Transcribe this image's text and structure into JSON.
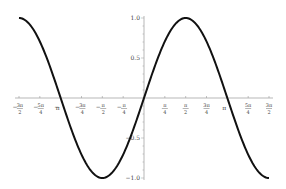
{
  "chart_data": {
    "type": "line",
    "title": "",
    "xlabel": "",
    "ylabel": "",
    "function": "sin(x)",
    "xlim": [
      -4.712,
      4.712
    ],
    "ylim": [
      -1.0,
      1.0
    ],
    "grid": false,
    "legend": null,
    "x_ticks": [
      {
        "value": -4.712,
        "label_num": "3π",
        "label_den": "2",
        "sign": "-"
      },
      {
        "value": -3.927,
        "label_num": "5π",
        "label_den": "4",
        "sign": "-"
      },
      {
        "value": -3.1416,
        "label_num": "π",
        "label_den": "",
        "sign": "-"
      },
      {
        "value": -2.356,
        "label_num": "3π",
        "label_den": "4",
        "sign": "-"
      },
      {
        "value": -1.571,
        "label_num": "π",
        "label_den": "2",
        "sign": "-"
      },
      {
        "value": -0.785,
        "label_num": "π",
        "label_den": "4",
        "sign": "-"
      },
      {
        "value": 0.785,
        "label_num": "π",
        "label_den": "4",
        "sign": ""
      },
      {
        "value": 1.571,
        "label_num": "π",
        "label_den": "2",
        "sign": ""
      },
      {
        "value": 2.356,
        "label_num": "3π",
        "label_den": "4",
        "sign": ""
      },
      {
        "value": 3.1416,
        "label_num": "π",
        "label_den": "",
        "sign": ""
      },
      {
        "value": 3.927,
        "label_num": "5π",
        "label_den": "4",
        "sign": ""
      },
      {
        "value": 4.712,
        "label_num": "3π",
        "label_den": "2",
        "sign": ""
      }
    ],
    "y_ticks": [
      {
        "value": 1.0,
        "label": "1.0"
      },
      {
        "value": 0.5,
        "label": "0.5"
      },
      {
        "value": -0.5,
        "label": "-0.5"
      },
      {
        "value": -1.0,
        "label": "-1.0"
      }
    ],
    "series": [
      {
        "name": "sin(x)",
        "color": "#111111",
        "x": [
          -4.712,
          -3.927,
          -3.1416,
          -2.356,
          -1.571,
          -0.785,
          0,
          0.785,
          1.571,
          2.356,
          3.1416,
          3.927,
          4.712
        ],
        "y": [
          1.0,
          0.707,
          0.0,
          -0.707,
          -1.0,
          -0.707,
          0.0,
          0.707,
          1.0,
          0.707,
          0.0,
          -0.707,
          -1.0
        ]
      }
    ]
  },
  "layout": {
    "px_x_min": 19,
    "px_x_max": 269,
    "px_y_top": 18,
    "px_y_bottom": 178,
    "axis_color": "#999999",
    "curve_color": "#111111"
  }
}
